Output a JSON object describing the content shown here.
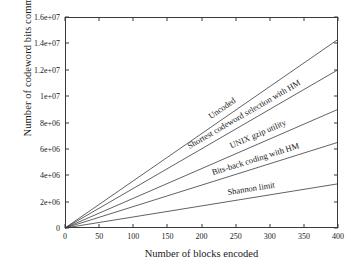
{
  "chart_data": {
    "type": "line",
    "title": "",
    "xlabel": "Number of blocks encoded",
    "ylabel": "Number of codeword bits communicated",
    "xlim": [
      0,
      400
    ],
    "ylim": [
      0,
      16000000
    ],
    "grid": false,
    "legend_position": "inline-along-curves",
    "xticks": [
      "0",
      "50",
      "100",
      "150",
      "200",
      "250",
      "300",
      "350",
      "400"
    ],
    "xtick_values": [
      0,
      50,
      100,
      150,
      200,
      250,
      300,
      350,
      400
    ],
    "yticks": [
      "0",
      "2e+06",
      "4e+06",
      "6e+06",
      "8e+06",
      "1e+07",
      "1.2e+07",
      "1.4e+07",
      "1.6e+07"
    ],
    "ytick_values": [
      0,
      2000000,
      4000000,
      6000000,
      8000000,
      10000000,
      12000000,
      14000000,
      16000000
    ],
    "x": [
      0,
      400
    ],
    "series": [
      {
        "name": "Uncoded",
        "values": [
          0,
          14300000
        ],
        "slope": 35750,
        "color": "#3a3a3a"
      },
      {
        "name": "Shortest codeword selection with HM",
        "values": [
          0,
          12000000
        ],
        "slope": 30000,
        "color": "#3a3a3a"
      },
      {
        "name": "UNIX gzip utility",
        "values": [
          0,
          9000000
        ],
        "slope": 22500,
        "color": "#3a3a3a"
      },
      {
        "name": "Bits-back coding with HM",
        "values": [
          0,
          6500000
        ],
        "slope": 16250,
        "color": "#3a3a3a"
      },
      {
        "name": "Shannon limit",
        "values": [
          0,
          3350000
        ],
        "slope": 8375,
        "color": "#3a3a3a"
      }
    ]
  },
  "axes": {
    "x_axis_label": "Number of blocks encoded",
    "y_axis_label": "Number of codeword bits communicated"
  },
  "colors": {
    "background": "#ffffff",
    "axis": "#3a3a3a",
    "line": "#3a3a3a",
    "text": "#1a1a1a"
  }
}
